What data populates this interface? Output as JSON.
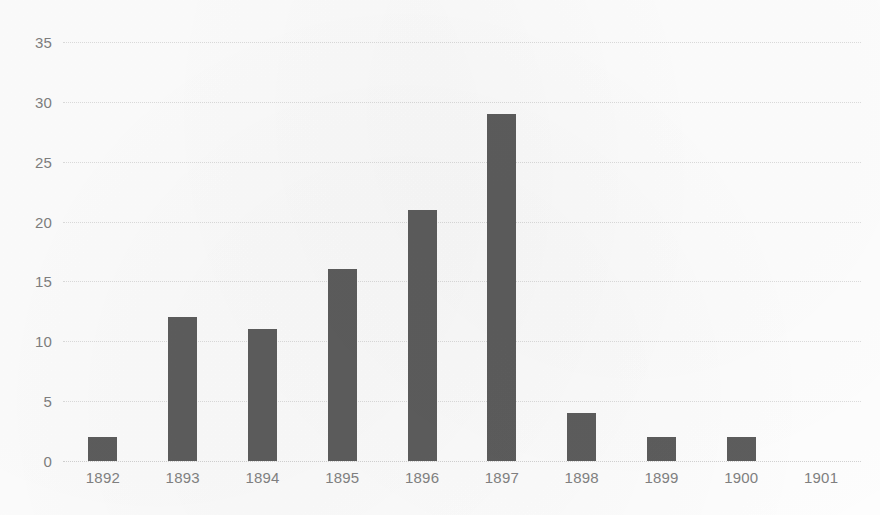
{
  "chart_data": {
    "type": "bar",
    "title": "",
    "subtitle": "",
    "xlabel": "",
    "ylabel": "",
    "categories": [
      "1892",
      "1893",
      "1894",
      "1895",
      "1896",
      "1897",
      "1898",
      "1899",
      "1900",
      "1901"
    ],
    "values": [
      2,
      12,
      11,
      16,
      21,
      29,
      4,
      2,
      2,
      0
    ],
    "ylim": [
      0,
      35
    ],
    "ytick_labels": [
      "0",
      "5",
      "10",
      "15",
      "20",
      "25",
      "30",
      "35"
    ],
    "ytick_values": [
      0,
      5,
      10,
      15,
      20,
      25,
      30,
      35
    ],
    "grid": "horizontal",
    "legend": "none",
    "annotations": [],
    "colors": {
      "bar": "#5d5d5d",
      "gridline": "#dcdcdc",
      "tick_label": "#7f7f7f",
      "background": "#fdfdfd"
    }
  }
}
